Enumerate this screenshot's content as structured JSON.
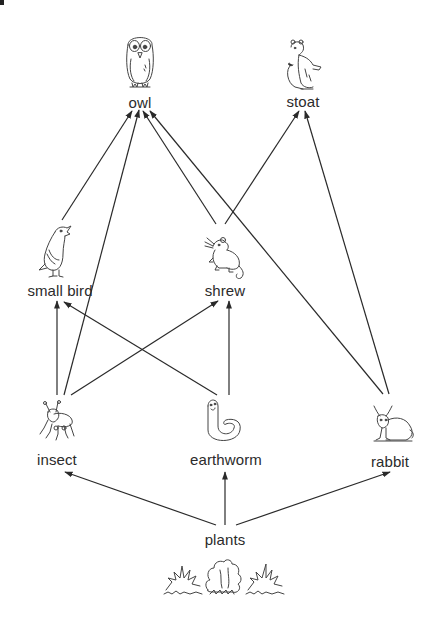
{
  "diagram": {
    "type": "food-web",
    "nodes": [
      {
        "id": "owl",
        "label": "owl",
        "icon": "owl-icon",
        "level": 4
      },
      {
        "id": "stoat",
        "label": "stoat",
        "icon": "stoat-icon",
        "level": 4
      },
      {
        "id": "small_bird",
        "label": "small bird",
        "icon": "small-bird-icon",
        "level": 3
      },
      {
        "id": "shrew",
        "label": "shrew",
        "icon": "shrew-icon",
        "level": 3
      },
      {
        "id": "insect",
        "label": "insect",
        "icon": "insect-icon",
        "level": 2
      },
      {
        "id": "earthworm",
        "label": "earthworm",
        "icon": "earthworm-icon",
        "level": 2
      },
      {
        "id": "rabbit",
        "label": "rabbit",
        "icon": "rabbit-icon",
        "level": 2
      },
      {
        "id": "plants",
        "label": "plants",
        "icon": "plants-icon",
        "level": 1
      }
    ],
    "edges": [
      {
        "from": "plants",
        "to": "insect"
      },
      {
        "from": "plants",
        "to": "earthworm"
      },
      {
        "from": "plants",
        "to": "rabbit"
      },
      {
        "from": "insect",
        "to": "small_bird"
      },
      {
        "from": "insect",
        "to": "shrew"
      },
      {
        "from": "insect",
        "to": "owl"
      },
      {
        "from": "earthworm",
        "to": "small_bird"
      },
      {
        "from": "earthworm",
        "to": "shrew"
      },
      {
        "from": "small_bird",
        "to": "owl"
      },
      {
        "from": "shrew",
        "to": "owl"
      },
      {
        "from": "shrew",
        "to": "stoat"
      },
      {
        "from": "rabbit",
        "to": "owl"
      },
      {
        "from": "rabbit",
        "to": "stoat"
      }
    ],
    "colors": {
      "line": "#2a2a2a",
      "text": "#2b2b2b",
      "background": "#ffffff"
    }
  }
}
